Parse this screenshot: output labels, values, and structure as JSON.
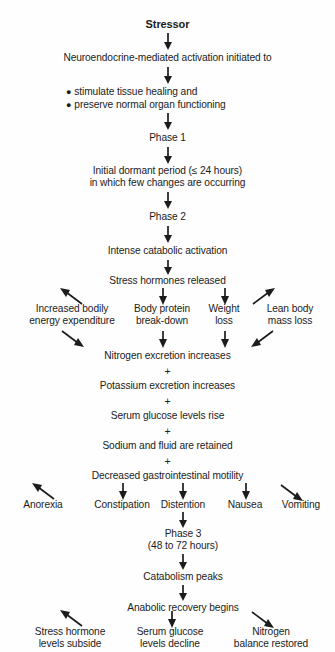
{
  "diagram": {
    "title": "Stressor",
    "type": "flowchart",
    "orientation": "top-to-bottom",
    "nodes": {
      "stressor": "Stressor",
      "neuroendocrine": "Neuroendocrine-mediated activation initiated to",
      "bullet_1": "stimulate tissue healing and",
      "bullet_2": "preserve normal organ functioning",
      "phase_1": "Phase 1",
      "dormant_period": "Initial dormant period (≤ 24 hours)\nin which few changes are occurring",
      "phase_2": "Phase 2",
      "intense_catabolic": "Intense catabolic activation",
      "stress_hormones": "Stress hormones released",
      "branch_energy": "Increased bodily\nenergy expenditure",
      "branch_protein": "Body protein\nbreak-down",
      "branch_weight": "Weight\nloss",
      "branch_lean": "Lean body\nmass loss",
      "nitrogen_excretion": "Nitrogen excretion increases",
      "plus_1": "+",
      "potassium_excretion": "Potassium excretion increases",
      "plus_2": "+",
      "serum_glucose_rise": "Serum glucose levels rise",
      "plus_3": "+",
      "sodium_fluid": "Sodium and fluid are retained",
      "plus_4": "+",
      "gi_motility": "Decreased gastrointestinal motility",
      "symptom_anorexia": "Anorexia",
      "symptom_constipation": "Constipation",
      "symptom_distention": "Distention",
      "symptom_nausea": "Nausea",
      "symptom_vomiting": "Vomiting",
      "phase_3": "Phase 3\n(48 to 72 hours)",
      "catabolism_peaks": "Catabolism peaks",
      "anabolic_recovery": "Anabolic recovery begins",
      "outcome_hormone": "Stress hormone\nlevels subside",
      "outcome_glucose": "Serum glucose\nlevels decline",
      "outcome_nitrogen": "Nitrogen\nbalance restored"
    }
  }
}
